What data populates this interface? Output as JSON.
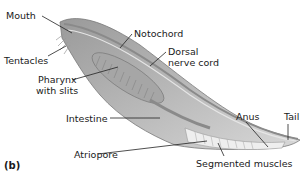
{
  "figure": {
    "panel_label": "(b)",
    "labels": {
      "mouth": "Mouth",
      "tentacles": "Tentacles",
      "pharynx_line1": "Pharynx",
      "pharynx_line2": "with slits",
      "notochord": "Notochord",
      "dorsal_line1": "Dorsal",
      "dorsal_line2": "nerve cord",
      "intestine": "Intestine",
      "atriopore": "Atriopore",
      "anus": "Anus",
      "tail": "Tail",
      "segmented_muscles": "Segmented muscles"
    }
  }
}
